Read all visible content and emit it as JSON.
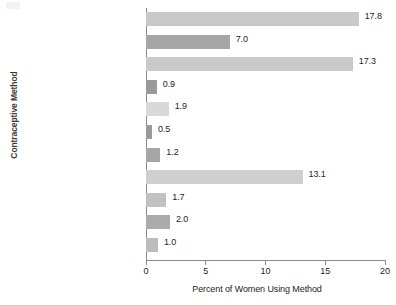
{
  "chart_data": {
    "type": "bar",
    "orientation": "horizontal",
    "title": "",
    "xlabel": "Percent of Women Using Method",
    "ylabel": "Contraceptive Method",
    "xlim": [
      0,
      20
    ],
    "xticks": [
      "0",
      "5",
      "10",
      "15",
      "20"
    ],
    "grid": false,
    "legend": "none",
    "categories": [
      "Female sterilization",
      "Male sterilization",
      "Pill",
      "Implant",
      "Injectable",
      "Intrauterine device",
      "Diaphragm",
      "Condom",
      "Periodic abstinence or\nnatural family planning",
      "Withdrawal",
      "Other methods*"
    ],
    "values": [
      17.8,
      7.0,
      17.3,
      0.9,
      1.9,
      0.5,
      1.2,
      13.1,
      1.7,
      2.0,
      1.0
    ],
    "value_labels": [
      "17.8",
      "7.0",
      "17.3",
      "0.9",
      "1.9",
      "0.5",
      "1.2",
      "13.1",
      "1.7",
      "2.0",
      "1.0"
    ],
    "bar_colors": [
      "#c9c9c9",
      "#a6a6a6",
      "#c9c9c9",
      "#9a9a9a",
      "#d9d9d9",
      "#9a9a9a",
      "#a6a6a6",
      "#cfcfcf",
      "#c2c2c2",
      "#ababab",
      "#bdbdbd"
    ]
  },
  "labels": {
    "cat_0": "Female sterilization",
    "cat_1": "Male sterilization",
    "cat_2": "Pill",
    "cat_3": "Implant",
    "cat_4": "Injectable",
    "cat_5": "Intrauterine device",
    "cat_6": "Diaphragm",
    "cat_7": "Condom",
    "cat_8_line1": "Periodic abstinence or",
    "cat_8_line2": "natural family planning",
    "cat_9": "Withdrawal",
    "cat_10": "Other methods*"
  }
}
